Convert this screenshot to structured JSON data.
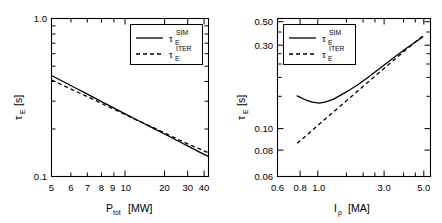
{
  "figure": {
    "background": "#ffffff",
    "line_color": "#000000",
    "panel_count": 2
  },
  "chart_data": [
    {
      "type": "line",
      "panel": "left",
      "title": "",
      "xlabel": "P_tot  [MW]",
      "xlabel_base": "P",
      "xlabel_sub": "tot",
      "xlabel_unit": "[MW]",
      "ylabel": "τ_E  [s]",
      "ylabel_base": "τ",
      "ylabel_sub": "E",
      "ylabel_unit": "[s]",
      "xscale": "log",
      "yscale": "log",
      "xlim": [
        5.0,
        45.0
      ],
      "ylim": [
        0.1,
        1.0
      ],
      "grid": false,
      "xticks": [
        5,
        6,
        7,
        8,
        9,
        10,
        20,
        30,
        40
      ],
      "xticklabels": [
        "5",
        "6",
        "7",
        "8",
        "9",
        "10",
        "20",
        "30",
        "40"
      ],
      "yticks": [
        0.1,
        1.0
      ],
      "yticklabels": [
        "0.1",
        "1.0"
      ],
      "legend_position": "upper-right",
      "series": [
        {
          "name": "τ_E^SIM",
          "label_base": "τ",
          "label_sub": "E",
          "label_sup": "SIM",
          "style": "solid",
          "x": [
            5.0,
            6.0,
            7.0,
            8.0,
            9.0,
            10.0,
            12.0,
            14.0,
            16.0,
            18.0,
            20.0,
            25.0,
            30.0,
            35.0,
            40.0,
            45.0
          ],
          "y": [
            0.436,
            0.395,
            0.363,
            0.338,
            0.317,
            0.299,
            0.271,
            0.249,
            0.232,
            0.218,
            0.206,
            0.183,
            0.166,
            0.153,
            0.142,
            0.134
          ]
        },
        {
          "name": "τ_E^ITER",
          "label_base": "τ",
          "label_sub": "E",
          "label_sup": "ITER",
          "style": "dashed",
          "x": [
            5.0,
            6.0,
            7.0,
            8.0,
            9.0,
            10.0,
            12.0,
            14.0,
            16.0,
            18.0,
            20.0,
            25.0,
            30.0,
            35.0,
            40.0,
            45.0
          ],
          "y": [
            0.408,
            0.374,
            0.347,
            0.325,
            0.307,
            0.291,
            0.266,
            0.247,
            0.231,
            0.218,
            0.208,
            0.186,
            0.17,
            0.158,
            0.149,
            0.141
          ]
        }
      ]
    },
    {
      "type": "line",
      "panel": "right",
      "title": "",
      "xlabel": "I_p  [MA]",
      "xlabel_base": "I",
      "xlabel_sub": "p",
      "xlabel_unit": "[MA]",
      "ylabel": "τ_E  [s]",
      "ylabel_base": "τ",
      "ylabel_sub": "E",
      "ylabel_unit": "[s]",
      "xscale": "log",
      "yscale": "log",
      "xlim": [
        0.6,
        5.6
      ],
      "ylim": [
        0.06,
        0.55
      ],
      "grid": false,
      "xticks": [
        0.6,
        0.8,
        1.0,
        3.0,
        5.0
      ],
      "xticklabels": [
        "0.6",
        "0.8",
        "1.0",
        "3.0",
        "5.0"
      ],
      "yticks": [
        0.06,
        0.08,
        0.1,
        0.3,
        0.5
      ],
      "yticklabels": [
        "0.06",
        "0.08",
        "0.10",
        "0.30",
        "0.50"
      ],
      "legend_position": "upper-left",
      "series": [
        {
          "name": "τ_E^SIM",
          "label_base": "τ",
          "label_sub": "E",
          "label_sup": "SIM",
          "style": "solid",
          "x": [
            0.8,
            0.9,
            1.0,
            1.1,
            1.2,
            1.35,
            1.5,
            1.75,
            2.0,
            2.3,
            2.6,
            3.0,
            3.5,
            4.0,
            4.5,
            5.0
          ],
          "y": [
            0.186,
            0.176,
            0.17,
            0.168,
            0.17,
            0.177,
            0.187,
            0.204,
            0.222,
            0.245,
            0.268,
            0.298,
            0.333,
            0.366,
            0.396,
            0.425
          ]
        },
        {
          "name": "τ_E^ITER",
          "label_base": "τ",
          "label_sub": "E",
          "label_sup": "ITER",
          "style": "dashed",
          "x": [
            0.8,
            1.0,
            1.2,
            1.5,
            1.75,
            2.0,
            2.3,
            2.6,
            3.0,
            3.5,
            4.0,
            4.5,
            5.0
          ],
          "y": [
            0.0955,
            0.115,
            0.134,
            0.161,
            0.183,
            0.2045,
            0.2295,
            0.254,
            0.2855,
            0.324,
            0.361,
            0.3965,
            0.43
          ]
        }
      ]
    }
  ]
}
